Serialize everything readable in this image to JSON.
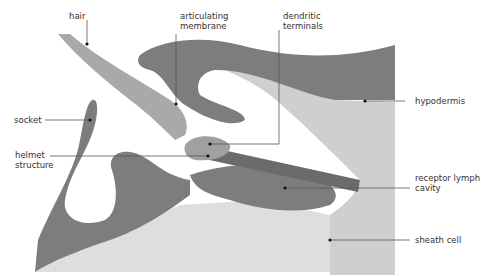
{
  "diagram": {
    "type": "anatomical cross-section",
    "colors": {
      "cuticle_dark": "#7d7d7d",
      "hypodermis_light": "#cfcfcf",
      "sheath_fill": "#dedede",
      "hair": "#a9a9a9",
      "leader_line": "#555555",
      "text": "#333333"
    }
  },
  "labels": {
    "hair": {
      "line1": "hair"
    },
    "articulating_membrane": {
      "line1": "articulating",
      "line2": "membrane"
    },
    "dendritic_terminals": {
      "line1": "dendritic",
      "line2": "terminals"
    },
    "hypodermis": {
      "line1": "hypodermis"
    },
    "socket": {
      "line1": "socket"
    },
    "helmet_structure": {
      "line1": "helmet",
      "line2": "structure"
    },
    "receptor_lymph_cavity": {
      "line1": "receptor lymph",
      "line2": "cavity"
    },
    "sheath_cell": {
      "line1": "sheath cell"
    }
  }
}
